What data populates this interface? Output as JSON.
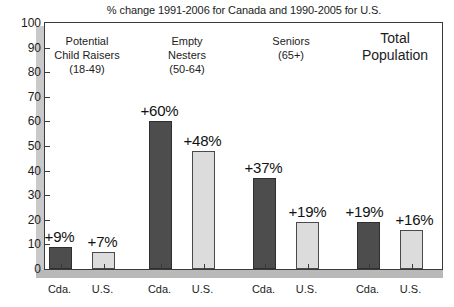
{
  "chart_data": {
    "type": "bar",
    "title": "% change 1991-2006 for Canada and 1990-2005 for U.S.",
    "xlabel": "",
    "ylabel": "",
    "ylim": [
      0,
      100
    ],
    "ytick_labels": [
      "100",
      "90",
      "80",
      "70",
      "60",
      "50",
      "40",
      "30",
      "20",
      "10",
      "0"
    ],
    "ytick_values": [
      100,
      90,
      80,
      70,
      60,
      50,
      40,
      30,
      20,
      10,
      0
    ],
    "grid": false,
    "legend": "none",
    "categories": [
      "Potential Child Raisers (18-49)",
      "Empty Nesters (50-64)",
      "Seniors (65+)",
      "Total Population"
    ],
    "groups": [
      {
        "header_lines": [
          "Potential",
          "Child Raisers",
          "(18-49)"
        ],
        "emphasis": false,
        "bars": [
          {
            "series": "Cda.",
            "value": 9,
            "label": "+9%",
            "color": "#4d4d4d"
          },
          {
            "series": "U.S.",
            "value": 7,
            "label": "+7%",
            "color": "#dcdcdc"
          }
        ]
      },
      {
        "header_lines": [
          "Empty",
          "Nesters",
          "(50-64)"
        ],
        "emphasis": false,
        "bars": [
          {
            "series": "Cda.",
            "value": 60,
            "label": "+60%",
            "color": "#4d4d4d"
          },
          {
            "series": "U.S.",
            "value": 48,
            "label": "+48%",
            "color": "#dcdcdc"
          }
        ]
      },
      {
        "header_lines": [
          "Seniors",
          "(65+)"
        ],
        "emphasis": false,
        "bars": [
          {
            "series": "Cda.",
            "value": 37,
            "label": "+37%",
            "color": "#4d4d4d"
          },
          {
            "series": "U.S.",
            "value": 19,
            "label": "+19%",
            "color": "#dcdcdc"
          }
        ]
      },
      {
        "header_lines": [
          "Total",
          "Population"
        ],
        "emphasis": true,
        "bars": [
          {
            "series": "Cda.",
            "value": 19,
            "label": "+19%",
            "color": "#4d4d4d"
          },
          {
            "series": "U.S.",
            "value": 16,
            "label": "+16%",
            "color": "#dcdcdc"
          }
        ]
      }
    ],
    "series": [
      {
        "name": "Cda.",
        "values": [
          9,
          60,
          37,
          19
        ]
      },
      {
        "name": "U.S.",
        "values": [
          7,
          48,
          19,
          16
        ]
      }
    ],
    "x_tick_labels": [
      "Cda.",
      "U.S.",
      "Cda.",
      "U.S.",
      "Cda.",
      "U.S.",
      "Cda.",
      "U.S."
    ]
  }
}
